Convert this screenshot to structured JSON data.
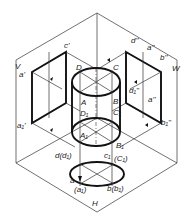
{
  "diagram": {
    "type": "three-plane projection of a cylinder",
    "planes": {
      "front": "V",
      "side": "W",
      "horizontal": "H"
    },
    "colors": {
      "line": "#111111",
      "thin_line": "#333333",
      "background": "#ffffff"
    },
    "labels": {
      "V": "V",
      "W": "W",
      "H": "H",
      "a_prime": "a'",
      "c_prime": "c'",
      "a1_prime": "a₁'",
      "d_dprime": "d''",
      "a_dprime_top": "a''",
      "b_dprime": "b''",
      "d1_dprime": "d₁''",
      "a_dprime_mid": "a''",
      "b1_dprime": "b₁''",
      "D": "D",
      "C": "C",
      "A": "A",
      "B": "B",
      "D1": "D₁",
      "C1": "C₁",
      "A1": "A₁",
      "B1": "B₁",
      "d_d": "d(d₁)",
      "c_c": "c₁",
      "C1_paren": "(C₁)",
      "a": "a",
      "a1_paren": "(a₁)",
      "b_b": "b(b₁)"
    }
  }
}
